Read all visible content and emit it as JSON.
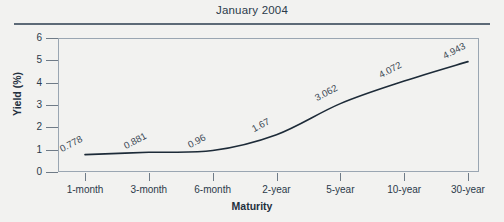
{
  "chart_data": {
    "type": "line",
    "title": "January 2004",
    "xlabel": "Maturity",
    "ylabel": "Yield (%)",
    "categories": [
      "1-month",
      "3-month",
      "6-month",
      "2-year",
      "5-year",
      "10-year",
      "30-year"
    ],
    "values": [
      0.778,
      0.881,
      0.96,
      1.67,
      3.062,
      4.072,
      4.943
    ],
    "point_labels": [
      "0.778",
      "0.881",
      "0.96",
      "1.67",
      "3.062",
      "4.072",
      "4.943"
    ],
    "ylim": [
      0,
      6
    ],
    "yticks": [
      0,
      1,
      2,
      3,
      4,
      5,
      6
    ],
    "ytick_labels": [
      "0",
      "1",
      "2",
      "3",
      "4",
      "5",
      "6"
    ],
    "grid": false,
    "legend": "none",
    "series": [
      {
        "name": "Yield",
        "values": [
          0.778,
          0.881,
          0.96,
          1.67,
          3.062,
          4.072,
          4.943
        ]
      }
    ],
    "colors": {
      "line": "#1d2b38",
      "axis": "#9aa6b2",
      "text": "#2b3a4a",
      "rule": "#5d6a77",
      "background": "#f2f2f0"
    }
  }
}
